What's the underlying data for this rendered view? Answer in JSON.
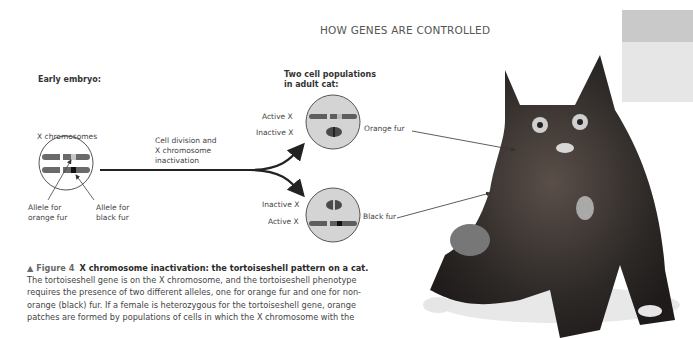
{
  "header": {
    "running_title": "HOW GENES ARE CONTROLLED"
  },
  "diagram": {
    "early_embryo_label": "Early embryo:",
    "x_chromosomes_label": "X chromosomes",
    "process_label_line1": "Cell division and",
    "process_label_line2": "X chromosome",
    "process_label_line3": "inactivation",
    "allele_orange_line1": "Allele for",
    "allele_orange_line2": "orange fur",
    "allele_black_line1": "Allele for",
    "allele_black_line2": "black fur",
    "adult_title_line1": "Two cell populations",
    "adult_title_line2": "in adult cat:",
    "top_cell": {
      "active_label": "Active X",
      "inactive_label": "Inactive X",
      "fur_label": "Orange fur"
    },
    "bottom_cell": {
      "inactive_label": "Inactive X",
      "active_label": "Active X",
      "fur_label": "Black fur"
    }
  },
  "caption": {
    "figure_marker": "▲ Figure 4",
    "title": "X chromosome inactivation: the tortoiseshell pattern on a cat.",
    "body": "The tortoiseshell gene is on the X chromosome, and the tortoiseshell phenotype requires the presence of two different alleles, one for orange fur and one for non-orange (black) fur. If a female is heterozygous for the tortoiseshell gene, orange patches are formed by populations of cells in which the X chromosome with the"
  },
  "photo": {
    "subject": "tortoiseshell cat photograph"
  },
  "colors": {
    "cell_fill": "#d4d4d4",
    "tab_top": "#c9c9c9",
    "tab_bottom": "#e6e6e6"
  }
}
